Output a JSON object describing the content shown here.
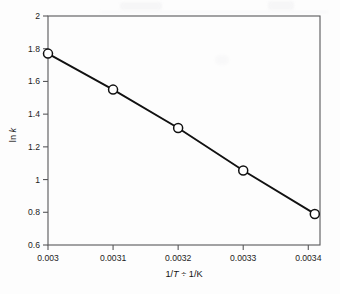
{
  "figure": {
    "background_color": "#fdfdfd",
    "frame_color": "#58585a",
    "line_color": "#111111",
    "marker_fill": "#ffffff"
  },
  "chart_data": {
    "type": "line",
    "title": "",
    "xlabel": "1/T ÷ 1/K",
    "xlabel_parts": {
      "pre": "1/",
      "italic": "T",
      "post": " ÷ 1/K"
    },
    "ylabel": "ln k",
    "ylabel_parts": {
      "pre": "ln ",
      "italic": "k",
      "post": ""
    },
    "x": [
      0.003,
      0.0031,
      0.0032,
      0.0033,
      0.00341
    ],
    "values": [
      1.77,
      1.55,
      1.315,
      1.055,
      0.79
    ],
    "xlim": [
      0.003,
      0.003418
    ],
    "ylim": [
      0.6,
      2.0
    ],
    "xticks": [
      0.003,
      0.0031,
      0.0032,
      0.0033,
      0.0034
    ],
    "xticklabels": [
      "0.003",
      "0.0031",
      "0.0032",
      "0.0033",
      "0.0034"
    ],
    "yticks": [
      0.6,
      0.8,
      1.0,
      1.2,
      1.4,
      1.6,
      1.8,
      2.0
    ],
    "yticklabels": [
      "0.6",
      "0.8",
      "1",
      "1.2",
      "1.4",
      "1.6",
      "1.8",
      "2"
    ],
    "grid": false,
    "legend": null,
    "marker": "open-circle",
    "marker_size": 9,
    "series": [
      {
        "name": "ln k vs 1/T",
        "values": [
          1.77,
          1.55,
          1.315,
          1.055,
          0.79
        ]
      }
    ],
    "annotations": []
  }
}
